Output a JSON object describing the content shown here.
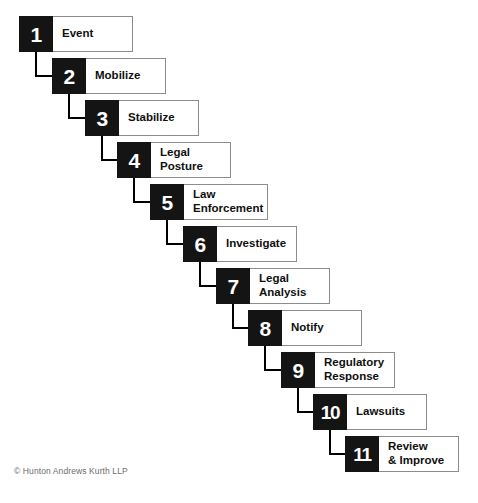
{
  "diagram": {
    "colors": {
      "number_block": "#141414",
      "number_text": "#ffffff",
      "label_background": "#ffffff",
      "label_border": "#8c8c8c",
      "label_text": "#101010",
      "connector": "#000000",
      "canvas": "#ffffff",
      "footer_text": "#6d6d6d"
    },
    "steps": [
      {
        "number": "1",
        "label": "Event",
        "lines": [
          "Event"
        ],
        "x": 19,
        "y": 16,
        "width": 114
      },
      {
        "number": "2",
        "label": "Mobilize",
        "lines": [
          "Mobilize"
        ],
        "x": 52,
        "y": 58,
        "width": 114
      },
      {
        "number": "3",
        "label": "Stabilize",
        "lines": [
          "Stabilize"
        ],
        "x": 85,
        "y": 100,
        "width": 114
      },
      {
        "number": "4",
        "label": "Legal Posture",
        "lines": [
          "Legal",
          "Posture"
        ],
        "x": 117,
        "y": 142,
        "width": 114
      },
      {
        "number": "5",
        "label": "Law Enforcement",
        "lines": [
          "Law",
          "Enforcement"
        ],
        "x": 150,
        "y": 184,
        "width": 116
      },
      {
        "number": "6",
        "label": "Investigate",
        "lines": [
          "Investigate"
        ],
        "x": 183,
        "y": 226,
        "width": 114
      },
      {
        "number": "7",
        "label": "Legal Analysis",
        "lines": [
          "Legal",
          "Analysis"
        ],
        "x": 216,
        "y": 268,
        "width": 114
      },
      {
        "number": "8",
        "label": "Notify",
        "lines": [
          "Notify"
        ],
        "x": 248,
        "y": 310,
        "width": 114
      },
      {
        "number": "9",
        "label": "Regulatory Response",
        "lines": [
          "Regulatory",
          "Response"
        ],
        "x": 281,
        "y": 352,
        "width": 114
      },
      {
        "number": "10",
        "label": "Lawsuits",
        "lines": [
          "Lawsuits"
        ],
        "x": 313,
        "y": 394,
        "width": 114
      },
      {
        "number": "11",
        "label": "Review & Improve",
        "lines": [
          "Review",
          "& Improve"
        ],
        "x": 345,
        "y": 436,
        "width": 114
      }
    ]
  },
  "footer": {
    "copyright": "© Hunton Andrews Kurth LLP"
  }
}
